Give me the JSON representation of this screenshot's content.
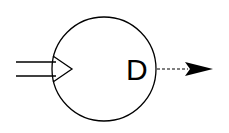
{
  "diagram": {
    "node": {
      "label": "D",
      "shape": "circle"
    },
    "input_arrow": {
      "style": "double-line-hollow",
      "direction": "right"
    },
    "output_arrow": {
      "style": "dashed",
      "direction": "right"
    },
    "colors": {
      "stroke": "#000000",
      "background": "#ffffff"
    }
  }
}
